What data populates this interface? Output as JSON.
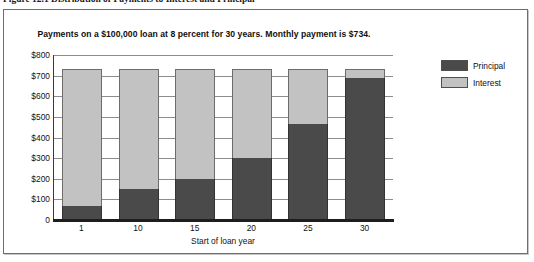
{
  "figure": {
    "caption": "Figure 12.1   Distribution of Payments to Interest and Principal"
  },
  "legend": {
    "position": "right",
    "entries": [
      {
        "label": "Principal",
        "color": "#4a4a4a"
      },
      {
        "label": "Interest",
        "color": "#c2c2c2"
      }
    ]
  },
  "chart_data": {
    "type": "bar",
    "subtype": "stacked",
    "title": "Payments on a $100,000 loan at 8 percent for 30 years. Monthly payment is $734.",
    "xlabel": "Start of loan year",
    "ylabel": "",
    "categories": [
      "1",
      "10",
      "15",
      "20",
      "25",
      "30"
    ],
    "ylim": [
      0,
      800
    ],
    "yticks": [
      0,
      100,
      200,
      300,
      400,
      500,
      600,
      700,
      800
    ],
    "ytick_labels": [
      "0",
      "$100",
      "$200",
      "$300",
      "$400",
      "$500",
      "$600",
      "$700",
      "$800"
    ],
    "grid": true,
    "total_payment": 734,
    "series": [
      {
        "name": "Principal",
        "color": "#4a4a4a",
        "values": [
          67,
          150,
          200,
          300,
          467,
          690
        ]
      },
      {
        "name": "Interest",
        "color": "#c2c2c2",
        "values": [
          667,
          584,
          534,
          434,
          267,
          44
        ]
      }
    ]
  }
}
